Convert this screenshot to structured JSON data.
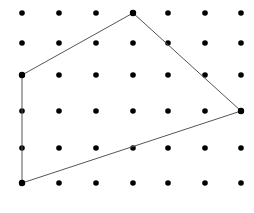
{
  "figure": {
    "width": 254,
    "height": 213,
    "background_color": "#ffffff"
  },
  "grid": {
    "name": "geoboard-peg-grid",
    "columns": 7,
    "rows": 6,
    "column_x": [
      22,
      59,
      96,
      133,
      168,
      205,
      241
    ],
    "row_y": [
      13,
      43,
      75,
      111,
      148,
      183
    ],
    "dot_radius": 2.8,
    "dot_color": "#000000"
  },
  "shape": {
    "name": "quadrilateral",
    "closed": true,
    "stroke_color": "#555555",
    "stroke_width": 1,
    "fill": "none",
    "vertices": [
      {
        "label": "left-vertex",
        "col": 1,
        "row": 3,
        "x": 22,
        "y": 75
      },
      {
        "label": "top-vertex",
        "col": 4,
        "row": 1,
        "x": 133,
        "y": 13
      },
      {
        "label": "right-vertex",
        "col": 7,
        "row": 4,
        "x": 241,
        "y": 111
      },
      {
        "label": "bottom-left-vertex",
        "col": 1,
        "row": 6,
        "x": 22,
        "y": 183
      }
    ],
    "points_string": "22,75 133,13 241,111 22,183"
  },
  "chart_data": {
    "type": "scatter",
    "xlabel": "",
    "ylabel": "",
    "xlim": [
      0,
      254
    ],
    "ylim": [
      0,
      213
    ],
    "grid": false,
    "legend": "none",
    "series": [
      {
        "name": "pegs",
        "x": [
          22,
          59,
          96,
          133,
          168,
          205,
          241,
          22,
          59,
          96,
          133,
          168,
          205,
          241,
          22,
          59,
          96,
          133,
          168,
          205,
          241,
          22,
          59,
          96,
          133,
          168,
          205,
          241,
          22,
          59,
          96,
          133,
          168,
          205,
          241,
          22,
          59,
          96,
          133,
          168,
          205,
          241
        ],
        "y": [
          13,
          13,
          13,
          13,
          13,
          13,
          13,
          43,
          43,
          43,
          43,
          43,
          43,
          43,
          75,
          75,
          75,
          75,
          75,
          75,
          75,
          111,
          111,
          111,
          111,
          111,
          111,
          111,
          148,
          148,
          148,
          148,
          148,
          148,
          148,
          183,
          183,
          183,
          183,
          183,
          183,
          183
        ]
      },
      {
        "name": "quadrilateral-outline",
        "x": [
          22,
          133,
          241,
          22,
          22
        ],
        "y": [
          75,
          13,
          111,
          183,
          75
        ]
      }
    ]
  }
}
